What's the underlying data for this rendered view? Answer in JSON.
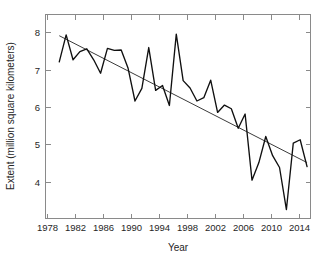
{
  "chart_data": {
    "type": "line",
    "title": "",
    "xlabel": "Year",
    "ylabel": "Extent (million square kilometers)",
    "xlim": [
      1977,
      2015.5
    ],
    "ylim": [
      3.35,
      8.35
    ],
    "xticks": [
      1978,
      1982,
      1986,
      1990,
      1994,
      1998,
      2002,
      2006,
      2010,
      2014
    ],
    "yticks": [
      4,
      5,
      6,
      7,
      8
    ],
    "grid": false,
    "legend": null,
    "x": [
      1979,
      1980,
      1981,
      1982,
      1983,
      1984,
      1985,
      1986,
      1987,
      1988,
      1989,
      1990,
      1991,
      1992,
      1993,
      1994,
      1995,
      1996,
      1997,
      1998,
      1999,
      2000,
      2001,
      2002,
      2003,
      2004,
      2005,
      2006,
      2007,
      2008,
      2009,
      2010,
      2011,
      2012,
      2013,
      2014,
      2015
    ],
    "series": [
      {
        "name": "September Arctic sea ice extent",
        "values": [
          7.19,
          7.85,
          7.24,
          7.44,
          7.51,
          7.24,
          6.91,
          7.52,
          7.47,
          7.48,
          7.03,
          6.23,
          6.54,
          7.54,
          6.49,
          6.61,
          6.12,
          7.87,
          6.73,
          6.55,
          6.23,
          6.31,
          6.74,
          5.95,
          6.13,
          6.04,
          5.56,
          5.91,
          4.29,
          4.72,
          5.36,
          4.89,
          4.6,
          3.57,
          5.2,
          5.28,
          4.62
        ]
      },
      {
        "name": "Linear trend",
        "type": "trend",
        "x_endpoints": [
          1979,
          2015
        ],
        "y_endpoints": [
          7.83,
          4.72
        ]
      }
    ]
  },
  "axes": {
    "ylabel": "Extent (million square kilometers)",
    "xlabel": "Year",
    "ytick_labels": [
      "8",
      "7",
      "6",
      "5",
      "4"
    ],
    "xtick_labels": [
      "1978",
      "1982",
      "1986",
      "1990",
      "1994",
      "1998",
      "2002",
      "2006",
      "2010",
      "2014"
    ]
  },
  "colors": {
    "data_line": "#101010",
    "trend_line": "#3b3b3b",
    "frame": "#8a8a8a",
    "text": "#262626",
    "background": "#ffffff"
  }
}
